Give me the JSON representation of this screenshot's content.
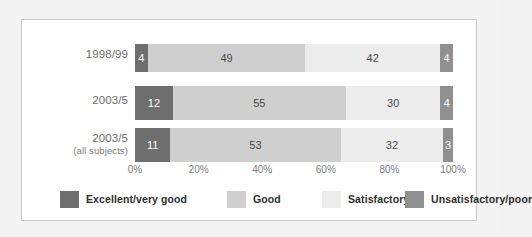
{
  "chart_data": {
    "type": "bar",
    "orientation": "horizontal",
    "stacked": true,
    "normalized_percent": true,
    "title": "",
    "subtitle": "",
    "xlabel": "",
    "ylabel": "",
    "xlim": [
      0,
      100
    ],
    "grid": false,
    "legend_position": "bottom",
    "categories": [
      "1998/99",
      "2003/5",
      "2003/5"
    ],
    "category_sublabels": [
      "",
      "",
      "(all subjects)"
    ],
    "series": [
      {
        "name": "Excellent/very good",
        "color": "#6e6e6e",
        "values": [
          4,
          12,
          11
        ]
      },
      {
        "name": "Good",
        "color": "#cfcfcf",
        "values": [
          49,
          55,
          53
        ]
      },
      {
        "name": "Satisfactory",
        "color": "#ececec",
        "values": [
          42,
          30,
          32
        ]
      },
      {
        "name": "Unsatisfactory/poor",
        "color": "#909090",
        "values": [
          4,
          4,
          3
        ]
      }
    ],
    "xticks": [
      {
        "value": 0,
        "label": "0%"
      },
      {
        "value": 20,
        "label": "20%"
      },
      {
        "value": 40,
        "label": "40%"
      },
      {
        "value": 60,
        "label": "60%"
      },
      {
        "value": 80,
        "label": "80%"
      },
      {
        "value": 100,
        "label": "100%"
      }
    ]
  },
  "rows": [
    {
      "label": "1998/99",
      "sublabel": "",
      "segments": [
        {
          "key": "excellent",
          "value": 4,
          "label": "4",
          "color": "#6e6e6e"
        },
        {
          "key": "good",
          "value": 49,
          "label": "49",
          "color": "#cfcfcf"
        },
        {
          "key": "satisfactory",
          "value": 42,
          "label": "42",
          "color": "#ececec"
        },
        {
          "key": "unsatisfactory",
          "value": 4,
          "label": "4",
          "color": "#909090"
        }
      ]
    },
    {
      "label": "2003/5",
      "sublabel": "",
      "segments": [
        {
          "key": "excellent",
          "value": 12,
          "label": "12",
          "color": "#6e6e6e"
        },
        {
          "key": "good",
          "value": 55,
          "label": "55",
          "color": "#cfcfcf"
        },
        {
          "key": "satisfactory",
          "value": 30,
          "label": "30",
          "color": "#ececec"
        },
        {
          "key": "unsatisfactory",
          "value": 4,
          "label": "4",
          "color": "#909090"
        }
      ]
    },
    {
      "label": "2003/5",
      "sublabel": "(all subjects)",
      "segments": [
        {
          "key": "excellent",
          "value": 11,
          "label": "11",
          "color": "#6e6e6e"
        },
        {
          "key": "good",
          "value": 53,
          "label": "53",
          "color": "#cfcfcf"
        },
        {
          "key": "satisfactory",
          "value": 32,
          "label": "32",
          "color": "#ececec"
        },
        {
          "key": "unsatisfactory",
          "value": 3,
          "label": "3",
          "color": "#909090"
        }
      ]
    }
  ],
  "axis": {
    "ticks": [
      "0%",
      "20%",
      "40%",
      "60%",
      "80%",
      "100%"
    ]
  },
  "legend": {
    "items": [
      {
        "label": "Excellent/very good",
        "color": "#6e6e6e"
      },
      {
        "label": "Good",
        "color": "#cfcfcf"
      },
      {
        "label": "Satisfactory",
        "color": "#ececec"
      },
      {
        "label": "Unsatisfactory/poor",
        "color": "#909090"
      }
    ]
  }
}
